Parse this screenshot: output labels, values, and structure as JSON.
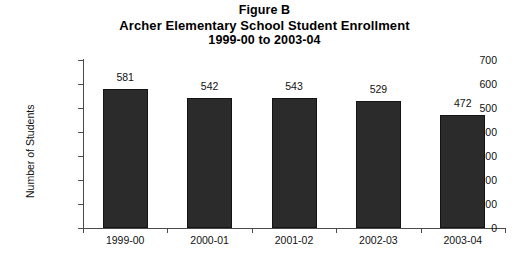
{
  "title": {
    "line1": "Figure B",
    "line2": "Archer Elementary School Student Enrollment",
    "line3": "1999-00 to 2003-04"
  },
  "chart_data": {
    "type": "bar",
    "title": "Figure B\nArcher Elementary School Student Enrollment\n1999-00 to 2003-04",
    "categories": [
      "1999-00",
      "2000-01",
      "2001-02",
      "2002-03",
      "2003-04"
    ],
    "values": [
      581,
      542,
      543,
      529,
      472
    ],
    "data_labels": [
      "581",
      "542",
      "543",
      "529",
      "472"
    ],
    "xlabel": "",
    "ylabel": "Number of Students",
    "ylim": [
      0,
      700
    ],
    "ytick_values": [
      0,
      100,
      200,
      300,
      400,
      500,
      600,
      700
    ],
    "ytick_labels": [
      "0",
      "100",
      "200",
      "300",
      "400",
      "500",
      "600",
      "700"
    ],
    "grid": false,
    "legend": false,
    "bar_color": "#2b2b2b",
    "axis_color": "#4a4a4a",
    "background": "#ffffff"
  }
}
